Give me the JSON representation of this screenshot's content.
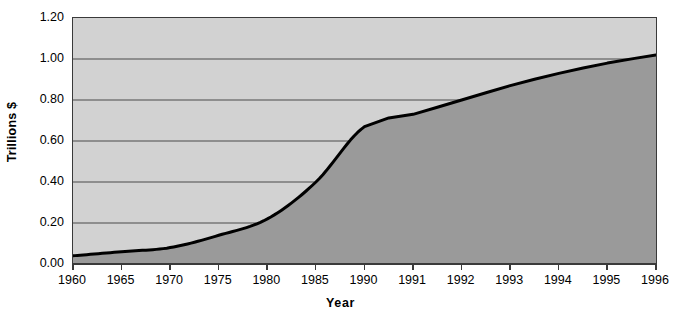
{
  "chart_data": {
    "type": "area",
    "title": "",
    "xlabel": "Year",
    "ylabel": "Trillions $",
    "x": [
      "1960",
      "1965",
      "1970",
      "1975",
      "1980",
      "1985",
      "1990",
      "1991",
      "1992",
      "1993",
      "1994",
      "1995",
      "1996"
    ],
    "categories": [
      "1960",
      "1965",
      "1970",
      "1975",
      "1980",
      "1985",
      "1990",
      "1991",
      "1992",
      "1993",
      "1994",
      "1995",
      "1996"
    ],
    "values": [
      0.04,
      0.06,
      0.08,
      0.14,
      0.22,
      0.4,
      0.67,
      0.73,
      0.8,
      0.87,
      0.93,
      0.98,
      1.02
    ],
    "series": [
      {
        "name": "Trillions $",
        "values": [
          0.04,
          0.06,
          0.08,
          0.14,
          0.22,
          0.4,
          0.67,
          0.73,
          0.8,
          0.87,
          0.93,
          0.98,
          1.02
        ]
      }
    ],
    "ylim": [
      0.0,
      1.2
    ],
    "ytick_labels": [
      "1.20",
      "1.00",
      "0.80",
      "0.60",
      "0.40",
      "0.20",
      "0.00"
    ],
    "ytick_values": [
      1.2,
      1.0,
      0.8,
      0.6,
      0.4,
      0.2,
      0.0
    ],
    "grid": true,
    "legend": "none",
    "colors": {
      "plot_background": "#d2d2d2",
      "area_fill": "#9a9a9a",
      "line": "#000000",
      "gridline": "#4a4a4a",
      "axis": "#3a3a3a",
      "text": "#000000",
      "page_background": "#ffffff"
    }
  }
}
